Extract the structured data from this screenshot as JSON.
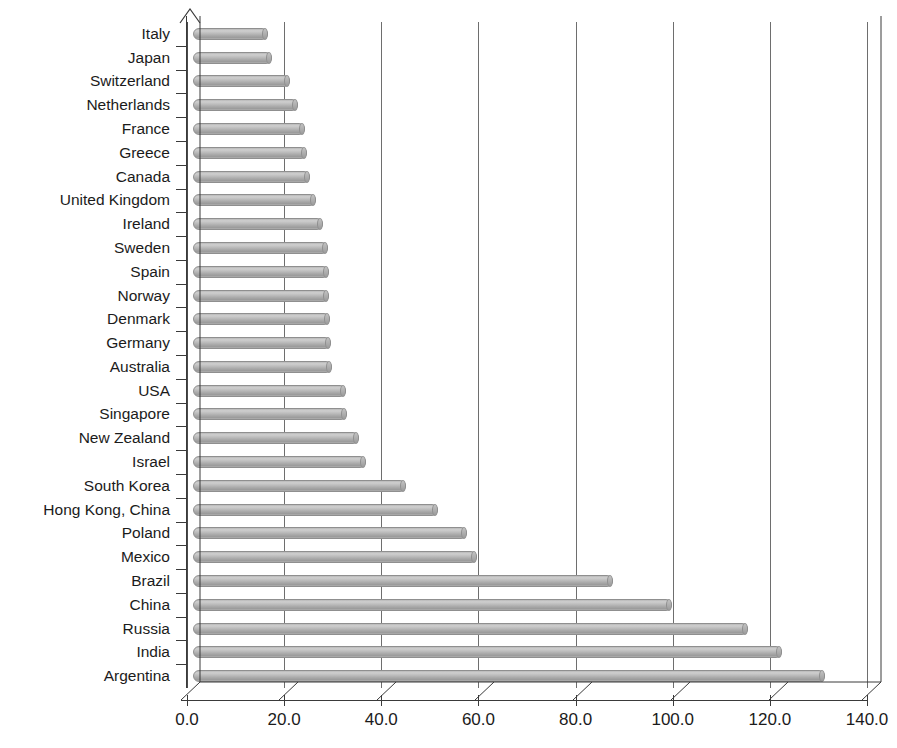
{
  "chart_data": {
    "type": "bar",
    "orientation": "horizontal",
    "title": "",
    "subtitle": "",
    "xlabel": "",
    "ylabel": "",
    "xlim": [
      0.0,
      140.0
    ],
    "xticks": [
      "0.0",
      "20.0",
      "40.0",
      "60.0",
      "80.0",
      "100.0",
      "120.0",
      "140.0"
    ],
    "xtick_values": [
      0,
      20,
      40,
      60,
      80,
      100,
      120,
      140
    ],
    "grid": "vertical",
    "legend": "none",
    "series_name": "",
    "categories": [
      "Italy",
      "Japan",
      "Switzerland",
      "Netherlands",
      "France",
      "Greece",
      "Canada",
      "United Kingdom",
      "Ireland",
      "Sweden",
      "Spain",
      "Norway",
      "Denmark",
      "Germany",
      "Australia",
      "USA",
      "Singapore",
      "New Zealand",
      "Israel",
      "South Korea",
      "Hong Kong, China",
      "Poland",
      "Mexico",
      "Brazil",
      "China",
      "Russia",
      "India",
      "Argentina"
    ],
    "values": [
      15.4,
      16.3,
      20.0,
      21.7,
      23.1,
      23.4,
      24.1,
      25.3,
      26.8,
      27.7,
      27.9,
      28.1,
      28.2,
      28.4,
      28.6,
      31.5,
      31.8,
      34.2,
      35.7,
      43.9,
      50.4,
      56.5,
      58.5,
      86.4,
      98.6,
      114.2,
      121.3,
      130.2
    ],
    "bar_color": "#b6b6b6",
    "bar_edge_color": "#8f8f8f",
    "axis_color": "#3a3a3a",
    "grid_color": "#6e6e6e",
    "background": "#ffffff"
  }
}
